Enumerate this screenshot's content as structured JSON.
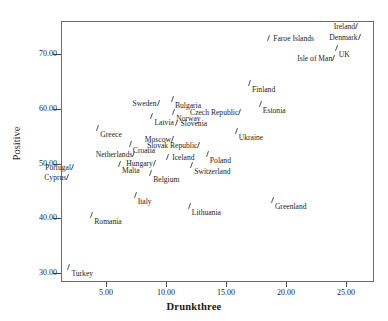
{
  "axes": {
    "xlabel": "Drunkthree",
    "ylabel": "Positive",
    "xticks": [
      "5.00",
      "10.00",
      "15.00",
      "20.00",
      "25.00"
    ],
    "xtick_values": [
      5,
      10,
      15,
      20,
      25
    ],
    "yticks": [
      "70.00",
      "60.00",
      "50.00",
      "40.00",
      "30.00"
    ],
    "ytick_values": [
      70,
      60,
      50,
      40,
      30
    ],
    "xlim": [
      1.3,
      27.3
    ],
    "ylim": [
      28.4,
      76.0
    ],
    "grid": false,
    "frame_color": "#6b6b6b",
    "marker_color": "#555555",
    "text_color": "#1c1c1c"
  },
  "chart_data": {
    "type": "scatter",
    "title": "",
    "xlabel": "Drunkthree",
    "ylabel": "Positive",
    "xlim": [
      1.3,
      27.3
    ],
    "ylim": [
      28.4,
      76.0
    ],
    "grid": false,
    "legend": null,
    "point_labels": true,
    "points": [
      {
        "label": "Ireland",
        "x": 25.9,
        "y": 75.2,
        "lpos": "lbl-left"
      },
      {
        "label": "Denmark",
        "x": 26.1,
        "y": 73.3,
        "lpos": "lbl-left"
      },
      {
        "label": "Faroe Islands",
        "x": 18.6,
        "y": 73.0,
        "lpos": "lbl-right-mid"
      },
      {
        "label": "UK",
        "x": 24.2,
        "y": 71.2,
        "lpos": "lbl-below"
      },
      {
        "label": "Isle of Man",
        "x": 24.0,
        "y": 69.4,
        "lpos": "lbl-left"
      },
      {
        "label": "Finland",
        "x": 17.0,
        "y": 64.9,
        "lpos": "lbl-below"
      },
      {
        "label": "Bulgaria",
        "x": 10.6,
        "y": 62.0,
        "lpos": "lbl-below"
      },
      {
        "label": "Sweden",
        "x": 9.4,
        "y": 61.2,
        "lpos": "lbl-left"
      },
      {
        "label": "Estonia",
        "x": 17.9,
        "y": 61.0,
        "lpos": "lbl-below"
      },
      {
        "label": "Norway",
        "x": 10.7,
        "y": 59.6,
        "lpos": "lbl-below"
      },
      {
        "label": "Czech Republic",
        "x": 16.2,
        "y": 59.6,
        "lpos": "lbl-left"
      },
      {
        "label": "Latvia",
        "x": 8.9,
        "y": 58.9,
        "lpos": "lbl-below"
      },
      {
        "label": "Slovenia",
        "x": 10.9,
        "y": 57.6,
        "lpos": "lbl-right-mid"
      },
      {
        "label": "Greece",
        "x": 4.4,
        "y": 56.7,
        "lpos": "lbl-below"
      },
      {
        "label": "Ukraine",
        "x": 15.9,
        "y": 56.1,
        "lpos": "lbl-below"
      },
      {
        "label": "Moscow",
        "x": 10.6,
        "y": 54.6,
        "lpos": "lbl-left"
      },
      {
        "label": "Croatia",
        "x": 7.1,
        "y": 53.8,
        "lpos": "lbl-below"
      },
      {
        "label": "Slovak Republic",
        "x": 12.8,
        "y": 53.6,
        "lpos": "lbl-left"
      },
      {
        "label": "Poland",
        "x": 13.5,
        "y": 52.0,
        "lpos": "lbl-below"
      },
      {
        "label": "Netherlands",
        "x": 7.4,
        "y": 51.9,
        "lpos": "lbl-left"
      },
      {
        "label": "Iceland",
        "x": 10.2,
        "y": 51.4,
        "lpos": "lbl-right-mid"
      },
      {
        "label": "Hungary",
        "x": 9.1,
        "y": 50.2,
        "lpos": "lbl-left"
      },
      {
        "label": "Switzerland",
        "x": 12.2,
        "y": 49.9,
        "lpos": "lbl-below"
      },
      {
        "label": "Malta",
        "x": 6.2,
        "y": 50.1,
        "lpos": "lbl-below"
      },
      {
        "label": "Portugal",
        "x": 2.3,
        "y": 49.5,
        "lpos": "lbl-left"
      },
      {
        "label": "Belgium",
        "x": 8.8,
        "y": 48.4,
        "lpos": "lbl-below"
      },
      {
        "label": "Cyprus",
        "x": 1.9,
        "y": 47.8,
        "lpos": "lbl-left"
      },
      {
        "label": "Italy",
        "x": 7.5,
        "y": 44.5,
        "lpos": "lbl-below"
      },
      {
        "label": "Greenland",
        "x": 18.9,
        "y": 43.6,
        "lpos": "lbl-below"
      },
      {
        "label": "Lithuania",
        "x": 12.0,
        "y": 42.5,
        "lpos": "lbl-below"
      },
      {
        "label": "Romania",
        "x": 3.9,
        "y": 40.8,
        "lpos": "lbl-below"
      },
      {
        "label": "Turkey",
        "x": 2.0,
        "y": 31.4,
        "lpos": "lbl-below"
      }
    ]
  }
}
